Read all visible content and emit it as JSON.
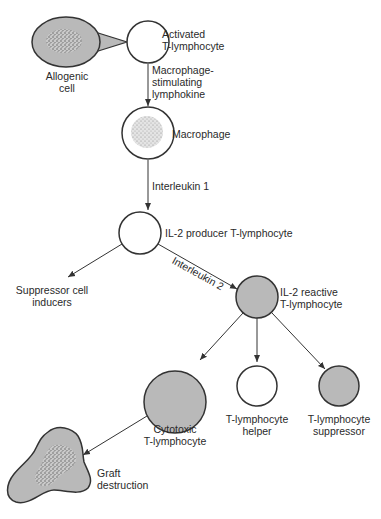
{
  "colors": {
    "cell_fill_gray": "#b9b9b9",
    "outline": "#333333",
    "background": "#ffffff",
    "speckle": "#6e6e6e"
  },
  "nodes": {
    "allogenic_cell": {
      "line1": "Allogenic",
      "line2": "cell"
    },
    "activated_t": {
      "line1": "Activated",
      "line2": "T-lymphocyte"
    },
    "macrophage": {
      "label": "Macrophage"
    },
    "il2_producer": {
      "label": "IL-2 producer T-lymphocyte"
    },
    "suppressor_inducers": {
      "line1": "Suppressor cell",
      "line2": "inducers"
    },
    "il2_reactive": {
      "line1": "IL-2 reactive",
      "line2": "T-lymphocyte"
    },
    "cytotoxic": {
      "line1": "Cytotoxic",
      "line2": "T-lymphocyte"
    },
    "helper": {
      "line1": "T-lymphocyte",
      "line2": "helper"
    },
    "suppressor": {
      "line1": "T-lymphocyte",
      "line2": "suppressor"
    },
    "graft": {
      "line1": "Graft",
      "line2": "destruction"
    }
  },
  "edges": {
    "lymphokine": {
      "line1": "Macrophage-",
      "line2": "stimulating",
      "line3": "lymphokine"
    },
    "interleukin1": {
      "label": "Interleukin 1"
    },
    "interleukin2": {
      "label": "Interleukin 2"
    }
  }
}
